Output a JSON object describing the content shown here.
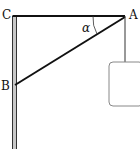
{
  "diagram": {
    "type": "statics-bracket",
    "labels": {
      "C": "C",
      "A": "A",
      "B": "B",
      "angle": "α"
    },
    "points": {
      "C": [
        14,
        16
      ],
      "A": [
        125,
        16
      ],
      "B": [
        14,
        85
      ]
    },
    "elements": [
      {
        "name": "wall",
        "description": "vertical wall / pole on the left"
      },
      {
        "name": "beam-CA",
        "description": "horizontal beam from C to A"
      },
      {
        "name": "strut-AB",
        "description": "diagonal strut from B to A"
      },
      {
        "name": "angle-arc",
        "description": "angle α at A between AC and AB"
      },
      {
        "name": "string",
        "description": "vertical string hanging from A"
      },
      {
        "name": "load-box",
        "description": "rounded box hanging from the string"
      }
    ],
    "colors": {
      "line": "#111111",
      "wall_fill": "#bdbdbd",
      "box_stroke": "#888888",
      "box_fill": "#ffffff"
    }
  }
}
